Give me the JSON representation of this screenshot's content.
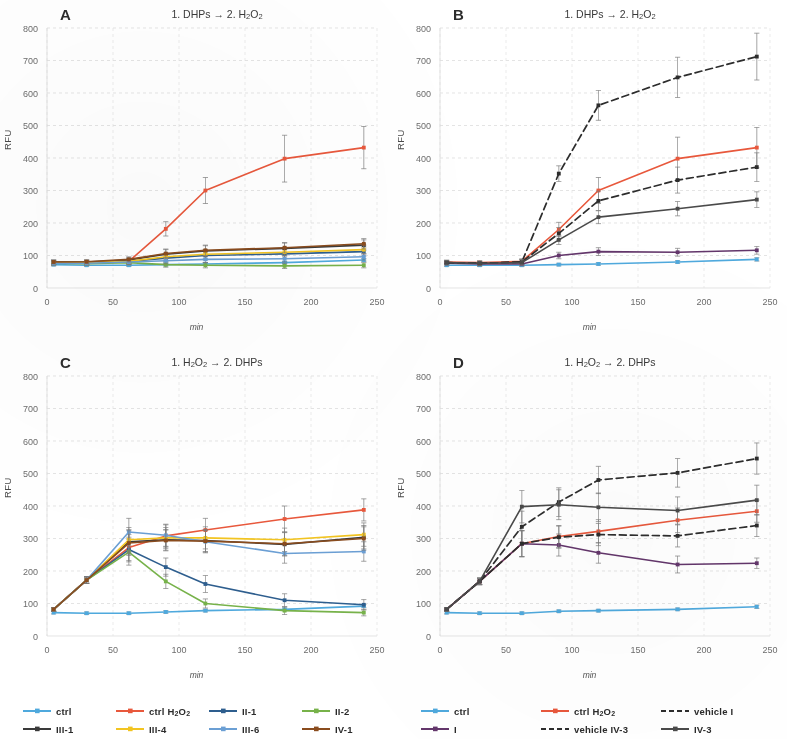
{
  "figure": {
    "axis": {
      "ylabel": "RFU",
      "xlabel": "min",
      "yticks": [
        "0",
        "100",
        "200",
        "300",
        "400",
        "500",
        "600",
        "700",
        "800"
      ],
      "xticks": [
        "0",
        "50",
        "100",
        "150",
        "200",
        "250"
      ],
      "ylim": [
        0,
        800
      ],
      "xlim": [
        0,
        250
      ]
    },
    "panels": [
      {
        "letter": "A",
        "title_html": "1. DHPs &#8594; 2. H<sub>2</sub>O<sub>2</sub>"
      },
      {
        "letter": "B",
        "title_html": "1. DHPs &#8594; 2. H<sub>2</sub>O<sub>2</sub>"
      },
      {
        "letter": "C",
        "title_html": "1. H<sub>2</sub>O<sub>2</sub> &#8594; 2. DHPs"
      },
      {
        "letter": "D",
        "title_html": "1. H<sub>2</sub>O<sub>2</sub> &#8594; 2. DHPs"
      }
    ],
    "legend_left": [
      {
        "label_html": "ctrl",
        "color": "#4fa9dd",
        "dashed": false
      },
      {
        "label_html": "ctrl  H<sub>2</sub>O<sub>2</sub>",
        "color": "#e8583c",
        "dashed": false
      },
      {
        "label_html": "II-1",
        "color": "#2e5e8e",
        "dashed": false
      },
      {
        "label_html": "II-2",
        "color": "#77b24a",
        "dashed": false
      },
      {
        "label_html": "III-1",
        "color": "#3a3a3a",
        "dashed": false
      },
      {
        "label_html": "III-4",
        "color": "#f2c421",
        "dashed": false
      },
      {
        "label_html": "III-6",
        "color": "#6b9fd4",
        "dashed": false
      },
      {
        "label_html": "IV-1",
        "color": "#8a4c1e",
        "dashed": false
      }
    ],
    "legend_right": [
      {
        "label_html": "ctrl",
        "color": "#4fa9dd",
        "dashed": false
      },
      {
        "label_html": "ctrl  H<sub>2</sub>O<sub>2</sub>",
        "color": "#e8583c",
        "dashed": false
      },
      {
        "label_html": "vehicle I",
        "color": "#2d2d2d",
        "dashed": true
      },
      {
        "label_html": "I",
        "color": "#63366b",
        "dashed": false
      },
      {
        "label_html": "vehicle IV-3",
        "color": "#2d2d2d",
        "dashed": true
      },
      {
        "label_html": "IV-3",
        "color": "#4a4a4a",
        "dashed": false
      }
    ]
  },
  "chart_data": [
    {
      "panel": "A",
      "type": "line",
      "title": "1. DHPs -> 2. H2O2",
      "xlabel": "min",
      "ylabel": "RFU",
      "xlim": [
        0,
        250
      ],
      "ylim": [
        0,
        800
      ],
      "grid": true,
      "x": [
        5,
        30,
        62,
        90,
        120,
        180,
        240
      ],
      "series": [
        {
          "name": "ctrl",
          "color": "#4fa9dd",
          "dashed": false,
          "values": [
            72,
            70,
            70,
            72,
            74,
            78,
            86
          ],
          "err": [
            4,
            4,
            4,
            4,
            4,
            4,
            5
          ]
        },
        {
          "name": "ctrl H2O2",
          "color": "#e8583c",
          "dashed": false,
          "values": [
            80,
            78,
            82,
            182,
            300,
            398,
            432
          ],
          "err": [
            6,
            6,
            8,
            22,
            40,
            72,
            65
          ]
        },
        {
          "name": "II-1",
          "color": "#2e5e8e",
          "dashed": false,
          "values": [
            78,
            78,
            82,
            92,
            100,
            105,
            112
          ],
          "err": [
            6,
            6,
            8,
            12,
            14,
            14,
            14
          ]
        },
        {
          "name": "II-2",
          "color": "#77b24a",
          "dashed": false,
          "values": [
            76,
            75,
            78,
            72,
            70,
            68,
            70
          ],
          "err": [
            6,
            6,
            7,
            8,
            8,
            8,
            8
          ]
        },
        {
          "name": "III-1",
          "color": "#3a3a3a",
          "dashed": false,
          "values": [
            80,
            80,
            86,
            104,
            114,
            122,
            132
          ],
          "err": [
            6,
            6,
            8,
            14,
            16,
            16,
            16
          ]
        },
        {
          "name": "III-4",
          "color": "#f2c421",
          "dashed": false,
          "values": [
            78,
            78,
            82,
            96,
            104,
            110,
            118
          ],
          "err": [
            6,
            6,
            8,
            12,
            14,
            14,
            14
          ]
        },
        {
          "name": "III-6",
          "color": "#6b9fd4",
          "dashed": false,
          "values": [
            76,
            76,
            80,
            84,
            88,
            90,
            96
          ],
          "err": [
            6,
            6,
            7,
            10,
            10,
            10,
            10
          ]
        },
        {
          "name": "IV-1",
          "color": "#8a4c1e",
          "dashed": false,
          "values": [
            80,
            81,
            88,
            106,
            116,
            124,
            136
          ],
          "err": [
            6,
            6,
            8,
            14,
            16,
            16,
            16
          ]
        }
      ]
    },
    {
      "panel": "B",
      "type": "line",
      "title": "1. DHPs -> 2. H2O2",
      "xlabel": "min",
      "ylabel": "RFU",
      "xlim": [
        0,
        250
      ],
      "ylim": [
        0,
        800
      ],
      "grid": true,
      "x": [
        5,
        30,
        62,
        90,
        120,
        180,
        240
      ],
      "series": [
        {
          "name": "ctrl",
          "color": "#4fa9dd",
          "dashed": false,
          "values": [
            70,
            70,
            70,
            72,
            74,
            80,
            88
          ],
          "err": [
            4,
            4,
            4,
            4,
            4,
            4,
            5
          ]
        },
        {
          "name": "ctrl H2O2",
          "color": "#e8583c",
          "dashed": false,
          "values": [
            80,
            78,
            82,
            180,
            300,
            398,
            432
          ],
          "err": [
            6,
            6,
            8,
            22,
            40,
            66,
            62
          ]
        },
        {
          "name": "vehicle I",
          "color": "#2d2d2d",
          "dashed": true,
          "values": [
            78,
            76,
            80,
            352,
            562,
            648,
            712
          ],
          "err": [
            6,
            6,
            8,
            24,
            46,
            62,
            72
          ]
        },
        {
          "name": "I",
          "color": "#63366b",
          "dashed": false,
          "values": [
            76,
            74,
            74,
            100,
            112,
            110,
            116
          ],
          "err": [
            6,
            6,
            6,
            10,
            12,
            12,
            12
          ]
        },
        {
          "name": "vehicle IV-3",
          "color": "#2d2d2d",
          "dashed": true,
          "values": [
            78,
            76,
            80,
            168,
            268,
            332,
            372
          ],
          "err": [
            6,
            6,
            8,
            18,
            30,
            40,
            44
          ]
        },
        {
          "name": "IV-3",
          "color": "#4a4a4a",
          "dashed": false,
          "values": [
            78,
            76,
            78,
            148,
            218,
            244,
            272
          ],
          "err": [
            6,
            6,
            8,
            14,
            20,
            22,
            24
          ]
        }
      ]
    },
    {
      "panel": "C",
      "type": "line",
      "title": "1. H2O2 -> 2. DHPs",
      "xlabel": "min",
      "ylabel": "RFU",
      "xlim": [
        0,
        250
      ],
      "ylim": [
        0,
        800
      ],
      "grid": true,
      "x": [
        5,
        30,
        62,
        90,
        120,
        180,
        240
      ],
      "series": [
        {
          "name": "ctrl",
          "color": "#4fa9dd",
          "dashed": false,
          "values": [
            72,
            70,
            70,
            74,
            78,
            82,
            92
          ],
          "err": [
            4,
            4,
            4,
            4,
            4,
            4,
            5
          ]
        },
        {
          "name": "ctrl H2O2",
          "color": "#e8583c",
          "dashed": false,
          "values": [
            82,
            172,
            272,
            308,
            326,
            360,
            388
          ],
          "err": [
            6,
            10,
            40,
            34,
            36,
            40,
            34
          ]
        },
        {
          "name": "II-1",
          "color": "#2e5e8e",
          "dashed": false,
          "values": [
            82,
            172,
            266,
            212,
            160,
            110,
            96
          ],
          "err": [
            6,
            10,
            38,
            28,
            26,
            20,
            16
          ]
        },
        {
          "name": "II-2",
          "color": "#77b24a",
          "dashed": false,
          "values": [
            82,
            172,
            258,
            168,
            100,
            78,
            72
          ],
          "err": [
            6,
            10,
            40,
            22,
            14,
            12,
            10
          ]
        },
        {
          "name": "III-1",
          "color": "#3a3a3a",
          "dashed": false,
          "values": [
            82,
            172,
            290,
            296,
            294,
            282,
            304
          ],
          "err": [
            6,
            10,
            38,
            32,
            34,
            36,
            36
          ]
        },
        {
          "name": "III-4",
          "color": "#f2c421",
          "dashed": false,
          "values": [
            82,
            172,
            296,
            302,
            302,
            296,
            312
          ],
          "err": [
            6,
            10,
            38,
            32,
            34,
            36,
            36
          ]
        },
        {
          "name": "III-6",
          "color": "#6b9fd4",
          "dashed": false,
          "values": [
            82,
            172,
            320,
            310,
            290,
            254,
            260
          ],
          "err": [
            6,
            10,
            42,
            34,
            34,
            30,
            30
          ]
        },
        {
          "name": "IV-1",
          "color": "#8a4c1e",
          "dashed": false,
          "values": [
            82,
            172,
            286,
            294,
            292,
            284,
            300
          ],
          "err": [
            6,
            10,
            38,
            32,
            34,
            36,
            36
          ]
        }
      ]
    },
    {
      "panel": "D",
      "type": "line",
      "title": "1. H2O2 -> 2. DHPs",
      "xlabel": "min",
      "ylabel": "RFU",
      "xlim": [
        0,
        250
      ],
      "ylim": [
        0,
        800
      ],
      "grid": true,
      "x": [
        5,
        30,
        62,
        90,
        120,
        180,
        240
      ],
      "series": [
        {
          "name": "ctrl",
          "color": "#4fa9dd",
          "dashed": false,
          "values": [
            72,
            70,
            70,
            76,
            78,
            82,
            90
          ],
          "err": [
            4,
            4,
            4,
            4,
            4,
            4,
            5
          ]
        },
        {
          "name": "ctrl H2O2",
          "color": "#e8583c",
          "dashed": false,
          "values": [
            82,
            168,
            284,
            306,
            322,
            356,
            384
          ],
          "err": [
            6,
            10,
            40,
            34,
            36,
            38,
            34
          ]
        },
        {
          "name": "vehicle I",
          "color": "#2d2d2d",
          "dashed": true,
          "values": [
            82,
            168,
            336,
            412,
            480,
            502,
            546
          ],
          "err": [
            6,
            10,
            48,
            44,
            42,
            44,
            48
          ]
        },
        {
          "name": "I",
          "color": "#63366b",
          "dashed": false,
          "values": [
            82,
            168,
            284,
            280,
            256,
            220,
            224
          ],
          "err": [
            6,
            10,
            40,
            34,
            32,
            26,
            16
          ]
        },
        {
          "name": "vehicle IV-3",
          "color": "#2d2d2d",
          "dashed": true,
          "values": [
            82,
            168,
            284,
            304,
            312,
            308,
            340
          ],
          "err": [
            6,
            10,
            40,
            34,
            34,
            34,
            34
          ]
        },
        {
          "name": "IV-3",
          "color": "#4a4a4a",
          "dashed": false,
          "values": [
            82,
            168,
            398,
            404,
            396,
            386,
            418
          ],
          "err": [
            6,
            10,
            50,
            46,
            44,
            42,
            46
          ]
        }
      ]
    }
  ]
}
